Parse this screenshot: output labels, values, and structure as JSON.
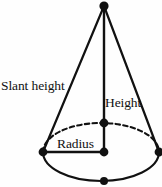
{
  "figure": {
    "name": "cone-geometry-diagram",
    "background_color": "#fefefe",
    "stroke_color": "#111111",
    "width": 162,
    "height": 187
  },
  "labels": {
    "slant_height": "Slant height",
    "height": "Height",
    "radius": "Radius"
  },
  "geometry": {
    "apex": {
      "x": 104,
      "y": 6
    },
    "base_center": {
      "x": 101,
      "y": 152
    },
    "base_rx": 58,
    "base_ry": 29,
    "left_vertex": {
      "x": 43,
      "y": 152
    },
    "right_vertex": {
      "x": 159,
      "y": 152
    },
    "back_point": {
      "x": 104,
      "y": 123
    },
    "front_point": {
      "x": 104,
      "y": 181
    },
    "back_arc_style": "dashed",
    "front_arc_style": "solid",
    "height_line": "apex-to-base-center",
    "radius_line": "left-vertex-to-base-center",
    "slant_lines": [
      "apex-to-left-vertex",
      "apex-to-right-vertex"
    ],
    "vertex_dot_radius": 4
  }
}
